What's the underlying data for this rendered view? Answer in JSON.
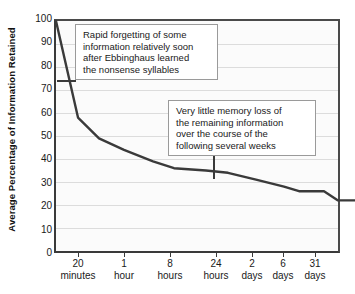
{
  "chart_data": {
    "type": "line",
    "title": "",
    "subtitle": "",
    "xlabel": "",
    "ylabel": "Average Percentage of Information Retained",
    "ylim": [
      0,
      100
    ],
    "y_ticks": [
      100,
      90,
      80,
      70,
      60,
      50,
      40,
      30,
      20,
      10,
      0
    ],
    "grid": true,
    "legend": "none",
    "categories": [
      "0",
      "20 minutes",
      "1 hour",
      "8 hours",
      "24 hours",
      "2 days",
      "6 days",
      "31 days"
    ],
    "x_tick_labels": [
      {
        "line1": "20",
        "line2": "minutes"
      },
      {
        "line1": "1",
        "line2": "hour"
      },
      {
        "line1": "8",
        "line2": "hours"
      },
      {
        "line1": "24",
        "line2": "hours"
      },
      {
        "line1": "2",
        "line2": "days"
      },
      {
        "line1": "6",
        "line2": "days"
      },
      {
        "line1": "31",
        "line2": "days"
      }
    ],
    "series": [
      {
        "name": "Information retained",
        "color": "#3a3a3a",
        "values": [
          100,
          58,
          44,
          36,
          34,
          28,
          26,
          22
        ]
      }
    ],
    "points": [
      {
        "x": 0,
        "y": 100
      },
      {
        "x": 22,
        "y": 58
      },
      {
        "x": 43,
        "y": 49
      },
      {
        "x": 68,
        "y": 44
      },
      {
        "x": 97,
        "y": 39
      },
      {
        "x": 118,
        "y": 36
      },
      {
        "x": 150,
        "y": 35
      },
      {
        "x": 172,
        "y": 34
      },
      {
        "x": 200,
        "y": 31
      },
      {
        "x": 228,
        "y": 28
      },
      {
        "x": 243,
        "y": 26
      },
      {
        "x": 268,
        "y": 26
      },
      {
        "x": 282,
        "y": 22
      },
      {
        "x": 300,
        "y": 22
      }
    ],
    "annotations": [
      {
        "id": "callout-1",
        "lines": [
          "Rapid forgetting of some",
          "information relatively soon",
          "after Ebbinghaus learned",
          "the nonsense syllables"
        ],
        "leader": "horizontal-left"
      },
      {
        "id": "callout-2",
        "lines": [
          "Very little memory loss of",
          "the remaining information",
          "over the course of the",
          "following several weeks"
        ],
        "leader": "vertical-down"
      }
    ],
    "colors": {
      "line": "#3a3a3a",
      "axis": "#3a3a3a",
      "grid": "#dcdcdc",
      "plot_background": "#fbfbfb",
      "callout_background": "#ffffff",
      "callout_border": "#9a9a9a",
      "text": "#1a1a1a"
    }
  }
}
